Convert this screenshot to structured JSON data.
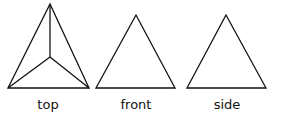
{
  "views": [
    {
      "id": "top",
      "label": "top"
    },
    {
      "id": "front",
      "label": "front"
    },
    {
      "id": "side",
      "label": "side"
    }
  ],
  "stroke_color": "#111111"
}
